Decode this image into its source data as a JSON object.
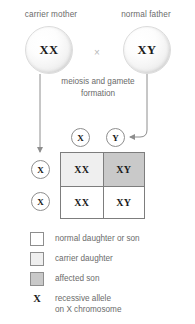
{
  "diagram": {
    "parents": {
      "mother": {
        "label": "carrier mother",
        "genotype": "XX",
        "icon": "sphere-icon"
      },
      "father": {
        "label": "normal father",
        "genotype": "XY",
        "icon": "sphere-icon"
      },
      "cross_symbol": "×"
    },
    "process_caption": "meiosis\nand gamete\nformation",
    "paternal_gametes": [
      {
        "allele": "X"
      },
      {
        "allele": "Y"
      }
    ],
    "maternal_gametes": [
      {
        "allele": "X"
      },
      {
        "allele": "X"
      }
    ],
    "punnett": {
      "cells": [
        {
          "genotype": "XX",
          "outcome": "carrier daughter",
          "fill": "#efefef"
        },
        {
          "genotype": "XY",
          "outcome": "affected son",
          "fill": "#c9c9c9"
        },
        {
          "genotype": "XX",
          "outcome": "normal daughter or son",
          "fill": "#ffffff"
        },
        {
          "genotype": "XY",
          "outcome": "normal daughter or son",
          "fill": "#ffffff"
        }
      ]
    },
    "legend": {
      "swatches": [
        {
          "label": "normal daughter or son",
          "fill": "#ffffff"
        },
        {
          "label": "carrier daughter",
          "fill": "#efefef"
        },
        {
          "label": "affected son",
          "fill": "#c9c9c9"
        }
      ],
      "allele_key": {
        "glyph": "X",
        "label": "recessive allele\non X chromosome"
      }
    },
    "colors": {
      "line": "#8e8e8e",
      "border": "#7d7d7d",
      "text": "#6b6b6b",
      "bold_text": "#1a1a1a"
    }
  }
}
